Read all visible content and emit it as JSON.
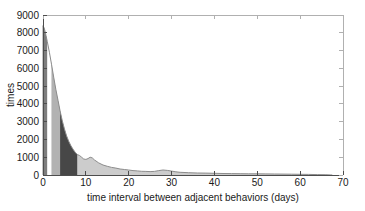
{
  "figure": {
    "background": "#ffffff"
  },
  "chart_data": {
    "type": "area",
    "title": "",
    "xlabel": "time interval between adjacent behaviors (days)",
    "ylabel": "times",
    "xlim": [
      0,
      70
    ],
    "ylim": [
      0,
      9000
    ],
    "x_ticks": [
      0,
      10,
      20,
      30,
      40,
      50,
      60,
      70
    ],
    "y_ticks": [
      0,
      1000,
      2000,
      3000,
      4000,
      5000,
      6000,
      7000,
      8000,
      9000
    ],
    "grid": false,
    "legend": null,
    "series": [
      {
        "name": "interval-frequency",
        "x": [
          0,
          0.3,
          0.7,
          1,
          1.5,
          2,
          2.5,
          3,
          3.5,
          4,
          4.5,
          5,
          5.5,
          6,
          6.5,
          7,
          7.5,
          8,
          8.5,
          9,
          9.5,
          10,
          10.5,
          11,
          11.5,
          12,
          13,
          14,
          15,
          16,
          17,
          18,
          19,
          20,
          21,
          22,
          23,
          24,
          25,
          26,
          27,
          28,
          29,
          30,
          31,
          32,
          34,
          36,
          38,
          40,
          42,
          44,
          46,
          48,
          50,
          52,
          54,
          56,
          58,
          60,
          62,
          64,
          66,
          67,
          67.5
        ],
        "y": [
          8400,
          8250,
          7850,
          7500,
          6900,
          6200,
          5500,
          4800,
          4200,
          3600,
          3050,
          2600,
          2200,
          1900,
          1650,
          1450,
          1280,
          1150,
          1100,
          1000,
          900,
          880,
          920,
          1000,
          960,
          850,
          680,
          560,
          490,
          430,
          390,
          340,
          310,
          280,
          250,
          230,
          210,
          200,
          190,
          200,
          250,
          280,
          260,
          220,
          180,
          150,
          130,
          115,
          105,
          95,
          85,
          80,
          75,
          70,
          65,
          60,
          55,
          50,
          45,
          40,
          35,
          25,
          15,
          5,
          0
        ]
      }
    ],
    "highlight_bands": [
      {
        "name": "band-0-1-days",
        "from": 0,
        "to": 1,
        "color": "#7d7d7d"
      },
      {
        "name": "band-1-2-days",
        "from": 1,
        "to": 2,
        "color": "#ffffff"
      },
      {
        "name": "band-2-4-days",
        "from": 2,
        "to": 4,
        "color": "#b2b2b2"
      },
      {
        "name": "band-4-8-days",
        "from": 4,
        "to": 8,
        "color": "#474747"
      }
    ],
    "colors": {
      "area_fill": "#cccccc",
      "area_outline": "#8c8c8c",
      "axis": "#4d4d4d",
      "frame": "#b0b0b0",
      "text": "#1a1a1a"
    }
  }
}
